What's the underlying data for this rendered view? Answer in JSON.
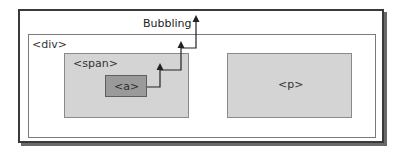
{
  "diagram": {
    "bubbling_label": "Bubbling",
    "elements": {
      "div": {
        "label": "<div>"
      },
      "span": {
        "label": "<span>"
      },
      "a": {
        "label": "<a>"
      },
      "p": {
        "label": "<p>"
      }
    },
    "flow": {
      "direction": "upward",
      "path": [
        "<a>",
        "<span>",
        "<div>",
        "document"
      ],
      "arrowheads": 3
    },
    "colors": {
      "frame_border": "#3a3a3a",
      "div_fill": "#ffffff",
      "span_fill": "#d4d4d4",
      "a_fill": "#9a9a9a",
      "p_fill": "#d4d4d4",
      "arrow": "#222222"
    }
  }
}
